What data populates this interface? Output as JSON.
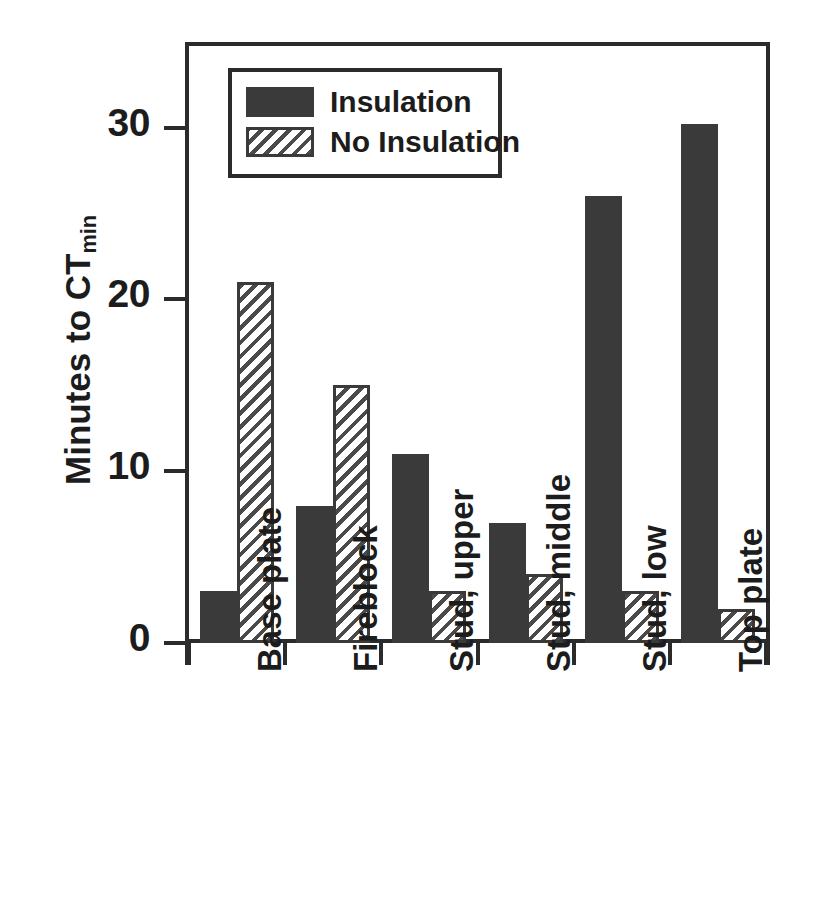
{
  "chart_data": {
    "type": "bar",
    "title": "",
    "xlabel": "",
    "ylabel": "Minutes to CT",
    "ylabel_sub": "min",
    "categories": [
      "Base plate",
      "Fireblock",
      "Stud, upper",
      "Stud, middle",
      "Stud, low",
      "Top plate"
    ],
    "series": [
      {
        "name": "Insulation",
        "values": [
          3,
          8,
          11,
          7,
          26,
          30.2
        ],
        "fill": "solid",
        "color": "#3a3a3a"
      },
      {
        "name": "No Insulation",
        "values": [
          21,
          15,
          3,
          4,
          3,
          2
        ],
        "fill": "hatched",
        "color": "#3a3a3a"
      }
    ],
    "ylim": [
      0,
      35
    ],
    "yticks": [
      0,
      10,
      20,
      30
    ],
    "ytick_labels": [
      "0",
      "10",
      "20",
      "30"
    ],
    "grid": false,
    "legend_position": "top-left",
    "axis_color": "#2b2b2b"
  },
  "legend": {
    "entries": [
      {
        "label": "Insulation"
      },
      {
        "label": "No Insulation"
      }
    ]
  }
}
